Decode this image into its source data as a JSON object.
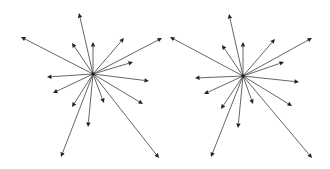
{
  "diagram": {
    "line_color": "#555555",
    "head_color": "#222222",
    "stars": [
      {
        "name": "left-star",
        "origin": [
          93,
          74
        ],
        "tips": [
          [
            79,
            13
          ],
          [
            21,
            37
          ],
          [
            93,
            42
          ],
          [
            72,
            43
          ],
          [
            124,
            38
          ],
          [
            162,
            38
          ],
          [
            133,
            62
          ],
          [
            47,
            77
          ],
          [
            149,
            81
          ],
          [
            53,
            93
          ],
          [
            143,
            104
          ],
          [
            72,
            107
          ],
          [
            104,
            103
          ],
          [
            88,
            127
          ],
          [
            61,
            157
          ],
          [
            159,
            158
          ]
        ]
      },
      {
        "name": "right-star",
        "origin": [
          243,
          76
        ],
        "tips": [
          [
            229,
            14
          ],
          [
            170,
            37
          ],
          [
            243,
            42
          ],
          [
            222,
            45
          ],
          [
            275,
            39
          ],
          [
            312,
            38
          ],
          [
            284,
            62
          ],
          [
            195,
            78
          ],
          [
            299,
            82
          ],
          [
            204,
            94
          ],
          [
            292,
            106
          ],
          [
            221,
            109
          ],
          [
            253,
            104
          ],
          [
            238,
            128
          ],
          [
            211,
            157
          ],
          [
            312,
            158
          ]
        ]
      }
    ]
  }
}
